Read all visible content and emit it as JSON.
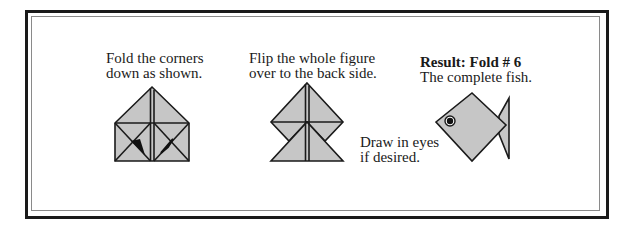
{
  "steps": [
    {
      "lines": [
        "Fold the corners",
        "down as shown."
      ]
    },
    {
      "lines": [
        "Flip the whole figure",
        "over to the back side."
      ]
    },
    {
      "title": "Result: Fold # 6",
      "lines": [
        "The complete fish."
      ]
    }
  ],
  "note": {
    "lines": [
      "Draw in eyes",
      "if desired."
    ]
  },
  "colors": {
    "fill": "#c6c6c6",
    "stroke": "#1a1a1a",
    "frame": "#1a1a1a",
    "inner_frame": "#8a8a8a"
  }
}
